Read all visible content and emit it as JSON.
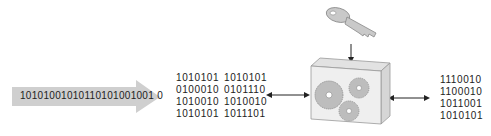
{
  "input_stream": {
    "bits": "10101001010110101001001 0"
  },
  "plaintext_block": {
    "columns": [
      [
        "1010101",
        "0100010",
        "1010010",
        "1010101"
      ],
      [
        "1010101",
        "0101110",
        "1010010",
        "1011101"
      ]
    ]
  },
  "ciphertext_block": {
    "rows": [
      "1110010",
      "1100010",
      "1011001",
      "1010101"
    ]
  },
  "icons": {
    "key": "key-icon",
    "cipher": "gear-box-icon",
    "stream_arrow": "arrow-right-icon"
  },
  "colors": {
    "stream_arrow": "#c8c8c8",
    "box_front": "#efefef",
    "box_side": "#d6d6d6",
    "box_top": "#e2e2e2",
    "gear": "#bdbdbd",
    "key": "#c9c9c9",
    "text": "#222222"
  }
}
